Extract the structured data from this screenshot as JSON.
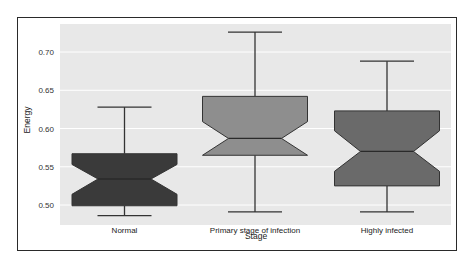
{
  "chart_data": {
    "type": "boxplot",
    "notched": true,
    "title": "",
    "xlabel": "Stage",
    "ylabel": "Energy",
    "ylim": [
      0.475,
      0.74
    ],
    "yticks": [
      0.5,
      0.55,
      0.6,
      0.65,
      0.7
    ],
    "ytick_labels": [
      "0.50",
      "0.55",
      "0.60",
      "0.65",
      "0.70"
    ],
    "grid": true,
    "categories": [
      "Normal",
      "Primary stage of infection",
      "Highly infected"
    ],
    "series": [
      {
        "name": "Normal",
        "whisker_low": 0.486,
        "q1": 0.499,
        "median": 0.534,
        "q3": 0.567,
        "whisker_high": 0.628,
        "notch_low": 0.514,
        "notch_high": 0.553,
        "color": "#3a3a3a"
      },
      {
        "name": "Primary stage of infection",
        "whisker_low": 0.491,
        "q1": 0.565,
        "median": 0.587,
        "q3": 0.642,
        "whisker_high": 0.726,
        "notch_low": 0.565,
        "notch_high": 0.609,
        "color": "#8e8e8e"
      },
      {
        "name": "Highly infected",
        "whisker_low": 0.491,
        "q1": 0.525,
        "median": 0.57,
        "q3": 0.623,
        "whisker_high": 0.688,
        "notch_low": 0.544,
        "notch_high": 0.597,
        "color": "#6a6a6a"
      }
    ]
  },
  "colors": {
    "plot_background": "#e8e8e8",
    "gridline": "#ffffff",
    "frame": "#2a2a2a"
  }
}
